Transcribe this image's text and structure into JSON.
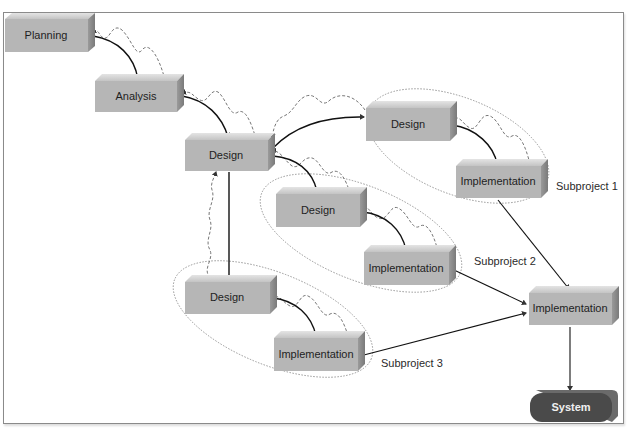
{
  "diagram": {
    "colors": {
      "box_front": "#b6b6b6",
      "box_top": "#d2d2d2",
      "box_side": "#8c8c8c",
      "system_fill": "#4a4a4a",
      "arrow": "#111111",
      "feedback": "#666666",
      "ellipse": "#8a8a8a"
    },
    "nodes": {
      "planning": {
        "label": "Planning",
        "x": 5,
        "y": 19,
        "w": 83,
        "h": 33
      },
      "analysis": {
        "label": "Analysis",
        "x": 95,
        "y": 81,
        "w": 82,
        "h": 31
      },
      "design_main": {
        "label": "Design",
        "x": 185,
        "y": 140,
        "w": 83,
        "h": 31
      },
      "design_sub1": {
        "label": "Design",
        "x": 366,
        "y": 108,
        "w": 84,
        "h": 33
      },
      "impl_sub1": {
        "label": "Implementation",
        "x": 456,
        "y": 166,
        "w": 85,
        "h": 32
      },
      "design_sub2": {
        "label": "Design",
        "x": 276,
        "y": 194,
        "w": 84,
        "h": 33
      },
      "impl_sub2": {
        "label": "Implementation",
        "x": 364,
        "y": 252,
        "w": 85,
        "h": 33
      },
      "design_sub3": {
        "label": "Design",
        "x": 185,
        "y": 282,
        "w": 85,
        "h": 32
      },
      "impl_sub3": {
        "label": "Implementation",
        "x": 274,
        "y": 338,
        "w": 84,
        "h": 33
      },
      "impl_final": {
        "label": "Implementation",
        "x": 529,
        "y": 293,
        "w": 83,
        "h": 32
      },
      "system": {
        "label": "System",
        "x": 530,
        "y": 393,
        "w": 82,
        "h": 29
      }
    },
    "subprojects": [
      {
        "label": "Subproject 1",
        "x": 556,
        "y": 187
      },
      {
        "label": "Subproject 2",
        "x": 474,
        "y": 262
      },
      {
        "label": "Subproject 3",
        "x": 381,
        "y": 364
      }
    ]
  }
}
